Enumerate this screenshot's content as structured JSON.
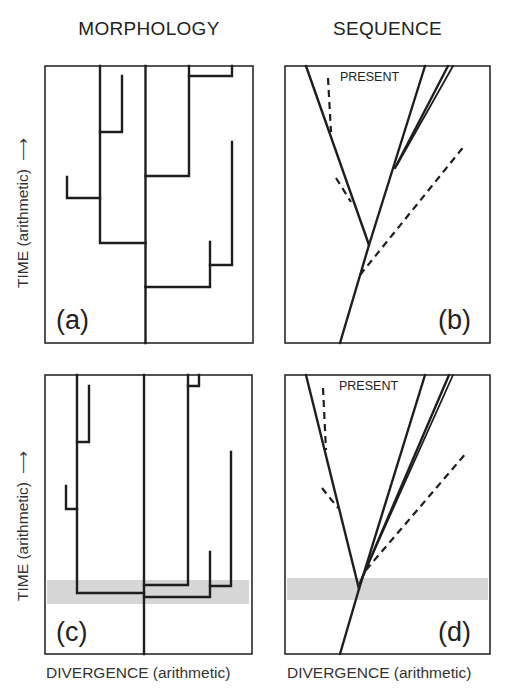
{
  "figure": {
    "columns": [
      {
        "title": "MORPHOLOGY",
        "xlabel": "DIVERGENCE (arithmetic)"
      },
      {
        "title": "SEQUENCE",
        "xlabel": "DIVERGENCE (arithmetic)"
      }
    ],
    "rows": [
      {
        "ylabel": "TIME (arithmetic)",
        "arrow": "⟶"
      },
      {
        "ylabel": "TIME (arithmetic)",
        "arrow": "⟶"
      }
    ],
    "panels": [
      {
        "id": "a",
        "label": "(a)",
        "type": "morphology-tree",
        "shaded_band": false
      },
      {
        "id": "b",
        "label": "(b)",
        "type": "sequence-tree",
        "annotation": "PRESENT",
        "shaded_band": false
      },
      {
        "id": "c",
        "label": "(c)",
        "type": "morphology-tree",
        "shaded_band": true
      },
      {
        "id": "d",
        "label": "(d)",
        "type": "sequence-tree",
        "annotation": "PRESENT",
        "shaded_band": true
      }
    ],
    "colors": {
      "line": "#1e1e1e",
      "frame": "#2a2a2a",
      "band": "#d6d6d6"
    }
  }
}
